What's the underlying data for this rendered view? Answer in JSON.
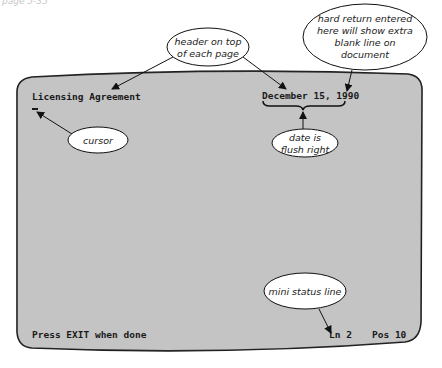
{
  "page_fragment": "page 5-35",
  "screen": {
    "header_left": "Licensing Agreement",
    "header_right": "December 15, 1990",
    "cursor": "_",
    "status_message": "Press EXIT when done",
    "status_line": "Ln 2",
    "status_pos": "Pos 10",
    "background": "#c4c4c4"
  },
  "callouts": {
    "header": [
      "header on top",
      "of each page"
    ],
    "hard_return": [
      "hard return entered",
      "here will show extra",
      "blank line on",
      "document"
    ],
    "cursor": [
      "cursor"
    ],
    "date": [
      "date is",
      "flush right"
    ],
    "status": [
      "mini status line"
    ]
  }
}
